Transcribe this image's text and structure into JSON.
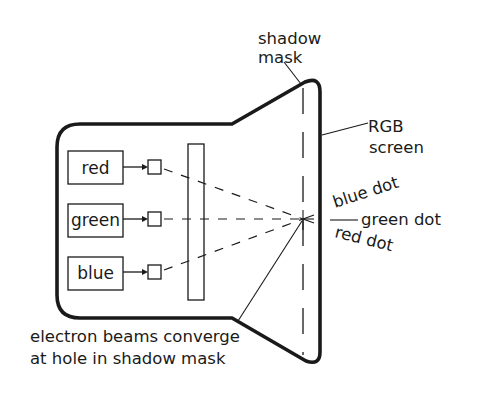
{
  "diagram": {
    "colors": {
      "ink": "#1a1a1a",
      "background": "#ffffff"
    },
    "guns": [
      {
        "label": "red"
      },
      {
        "label": "green"
      },
      {
        "label": "blue"
      }
    ],
    "labels": {
      "shadow_mask_line1": "shadow",
      "shadow_mask_line2": "mask",
      "rgb_screen_line1": "RGB",
      "rgb_screen_line2": "screen",
      "blue_dot": "blue dot",
      "green_dot": "green dot",
      "red_dot": "red dot",
      "converge_line1": "electron beams converge",
      "converge_line2": "at hole in shadow mask"
    }
  }
}
